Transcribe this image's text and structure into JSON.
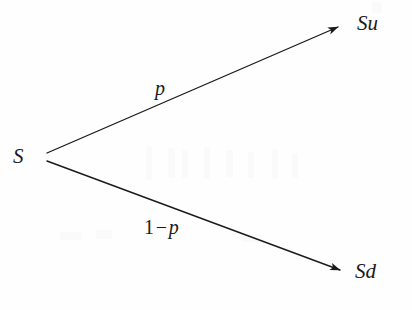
{
  "figure": {
    "kind": "binomial-tree-diagram",
    "background_color": "#fefefe",
    "stroke_color": "#1a1a1a",
    "nodes": [
      {
        "id": "root",
        "label": "S",
        "x": 42,
        "y": 157
      },
      {
        "id": "up",
        "label": "Su",
        "x": 342,
        "y": 25
      },
      {
        "id": "down",
        "label": "Sd",
        "x": 345,
        "y": 272
      }
    ],
    "branches": [
      {
        "id": "up-branch",
        "from": "root",
        "to": "up",
        "probability_label": "p",
        "x1": 47,
        "y1": 153,
        "x2": 342,
        "y2": 25
      },
      {
        "id": "down-branch",
        "from": "root",
        "to": "down",
        "probability_label": "1 − p",
        "probability_parts": {
          "one": "1",
          "minus": "−",
          "p": "p"
        },
        "x1": 47,
        "y1": 161,
        "x2": 345,
        "y2": 272
      }
    ]
  }
}
